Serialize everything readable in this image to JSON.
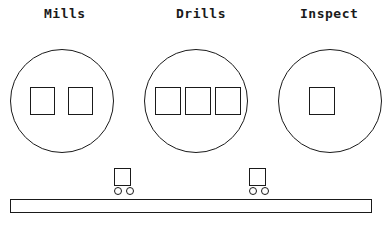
{
  "diagram": {
    "canvas": {
      "width": 385,
      "height": 232
    },
    "ink_color": "#1a1a1a",
    "background_color": "#ffffff",
    "stations": [
      {
        "id": "mills",
        "label": "Mills",
        "label_x": 44,
        "label_y": 6,
        "circle": {
          "cx": 62,
          "cy": 101,
          "r": 52
        },
        "machine_count": 2,
        "machines": [
          {
            "x": 30,
            "y": 87,
            "w": 25,
            "h": 28
          },
          {
            "x": 68,
            "y": 87,
            "w": 25,
            "h": 28
          }
        ]
      },
      {
        "id": "drills",
        "label": "Drills",
        "label_x": 176,
        "label_y": 6,
        "circle": {
          "cx": 196,
          "cy": 101,
          "r": 52
        },
        "machine_count": 3,
        "machines": [
          {
            "x": 155,
            "y": 87,
            "w": 26,
            "h": 28
          },
          {
            "x": 185,
            "y": 87,
            "w": 26,
            "h": 28
          },
          {
            "x": 215,
            "y": 87,
            "w": 26,
            "h": 28
          }
        ]
      },
      {
        "id": "inspect",
        "label": "Inspect",
        "label_x": 300,
        "label_y": 6,
        "circle": {
          "cx": 330,
          "cy": 101,
          "r": 52
        },
        "machine_count": 1,
        "machines": [
          {
            "x": 309,
            "y": 87,
            "w": 26,
            "h": 28
          }
        ]
      }
    ],
    "carts": [
      {
        "id": "cart-1",
        "body": {
          "x": 114,
          "y": 168,
          "w": 17,
          "h": 18
        },
        "wheels": [
          {
            "cx": 118,
            "cy": 191,
            "r": 4
          },
          {
            "cx": 130,
            "cy": 191,
            "r": 4
          }
        ]
      },
      {
        "id": "cart-2",
        "body": {
          "x": 249,
          "y": 168,
          "w": 17,
          "h": 18
        },
        "wheels": [
          {
            "cx": 253,
            "cy": 191,
            "r": 4
          },
          {
            "cx": 265,
            "cy": 191,
            "r": 4
          }
        ]
      }
    ],
    "conveyor": {
      "id": "conveyor-belt",
      "x": 10,
      "y": 199,
      "w": 362,
      "h": 14
    }
  }
}
